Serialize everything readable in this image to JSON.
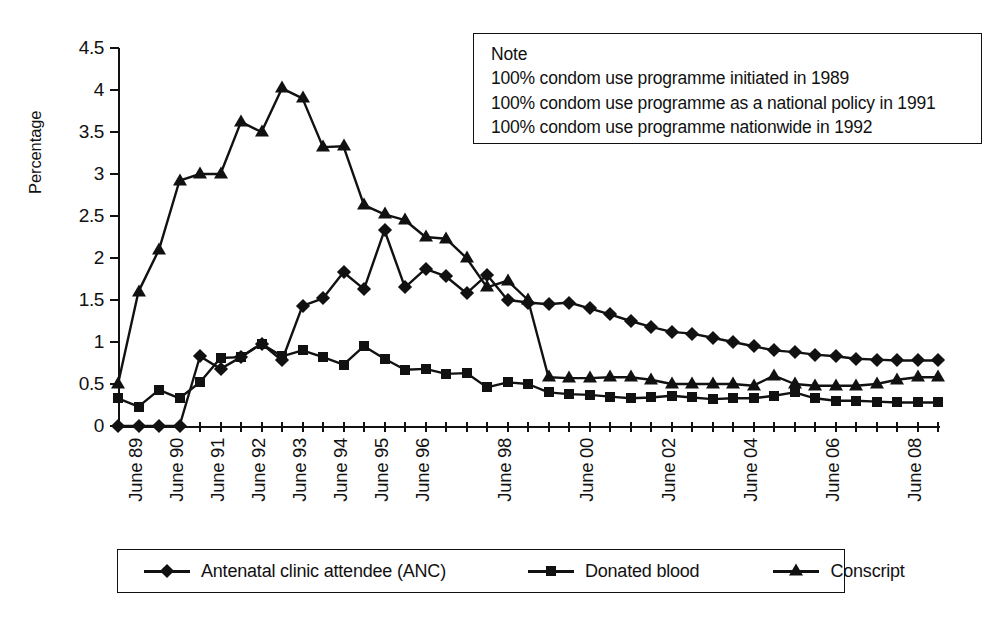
{
  "chart_data": {
    "type": "line",
    "title": "",
    "xlabel": "",
    "ylabel": "Percentage",
    "ylim": [
      0,
      4.5
    ],
    "yticks": [
      "0",
      "0.5",
      "1",
      "1.5",
      "2",
      "2.5",
      "3",
      "3.5",
      "4",
      "4.5"
    ],
    "grid": false,
    "legend_position": "bottom",
    "x": [
      "June 89",
      "Dec 89",
      "June 90",
      "Dec 90",
      "June 91",
      "Dec 91",
      "June 92",
      "Dec 92",
      "June 93",
      "Dec 93",
      "June 94",
      "Dec 94",
      "June 95",
      "Dec 95",
      "June 96",
      "Dec 96",
      "June 97",
      "Dec 97",
      "June 98",
      "Dec 98",
      "June 99",
      "Dec 99",
      "June 00",
      "Dec 00",
      "June 01",
      "Dec 01",
      "June 02",
      "Dec 02",
      "June 03",
      "Dec 03",
      "June 04",
      "Dec 04",
      "June 05",
      "Dec 05",
      "June 06",
      "Dec 06",
      "June 07",
      "Dec 07",
      "June 08",
      "Dec 08",
      "June 09"
    ],
    "xtick_labels": [
      {
        "index": 0,
        "label": "June 89"
      },
      {
        "index": 2,
        "label": "June 90"
      },
      {
        "index": 4,
        "label": "June 91"
      },
      {
        "index": 6,
        "label": "June 92"
      },
      {
        "index": 8,
        "label": "June 93"
      },
      {
        "index": 10,
        "label": "June 94"
      },
      {
        "index": 12,
        "label": "June 95"
      },
      {
        "index": 14,
        "label": "June 96"
      },
      {
        "index": 18,
        "label": "June 98"
      },
      {
        "index": 22,
        "label": "June 00"
      },
      {
        "index": 26,
        "label": "June 02"
      },
      {
        "index": 30,
        "label": "June 04"
      },
      {
        "index": 34,
        "label": "June 06"
      },
      {
        "index": 38,
        "label": "June 08"
      }
    ],
    "series": [
      {
        "name": "Antenatal clinic attendee (ANC)",
        "marker": "diamond",
        "values": [
          0.0,
          0.0,
          0.0,
          0.0,
          0.83,
          0.68,
          0.82,
          0.98,
          0.78,
          1.43,
          1.52,
          1.83,
          1.63,
          2.33,
          1.65,
          1.87,
          1.78,
          1.58,
          1.8,
          1.5,
          1.47,
          1.45,
          1.47,
          1.4,
          1.33,
          1.25,
          1.18,
          1.12,
          1.1,
          1.05,
          1.0,
          0.95,
          0.9,
          0.88,
          0.85,
          0.83,
          0.8,
          0.79,
          0.78,
          0.78,
          0.78
        ]
      },
      {
        "name": "Donated blood",
        "marker": "square",
        "values": [
          0.33,
          0.23,
          0.43,
          0.33,
          0.52,
          0.81,
          0.82,
          0.98,
          0.83,
          0.9,
          0.82,
          0.73,
          0.95,
          0.8,
          0.67,
          0.68,
          0.62,
          0.63,
          0.46,
          0.52,
          0.5,
          0.4,
          0.38,
          0.37,
          0.35,
          0.33,
          0.34,
          0.36,
          0.34,
          0.32,
          0.33,
          0.33,
          0.36,
          0.4,
          0.33,
          0.3,
          0.3,
          0.29,
          0.28,
          0.28,
          0.28
        ]
      },
      {
        "name": "Conscript",
        "marker": "triangle",
        "values": [
          0.5,
          1.6,
          2.1,
          2.92,
          3.0,
          3.0,
          3.62,
          3.5,
          4.02,
          3.9,
          3.32,
          3.33,
          2.63,
          2.52,
          2.45,
          2.25,
          2.23,
          2.0,
          1.65,
          1.73,
          1.5,
          0.58,
          0.57,
          0.57,
          0.58,
          0.58,
          0.55,
          0.5,
          0.5,
          0.5,
          0.5,
          0.48,
          0.6,
          0.5,
          0.48,
          0.48,
          0.48,
          0.5,
          0.55,
          0.58,
          0.58
        ]
      }
    ]
  },
  "note": {
    "heading": "Note",
    "lines": [
      "100% condom use programme initiated in 1989",
      "100% condom use programme as a national policy in 1991",
      "100% condom use programme nationwide in 1992"
    ]
  },
  "legend": {
    "items": [
      {
        "label": "Antenatal clinic attendee (ANC)",
        "marker": "diamond"
      },
      {
        "label": "Donated blood",
        "marker": "square"
      },
      {
        "label": "Conscript",
        "marker": "triangle"
      }
    ]
  },
  "colors": {
    "ink": "#111111",
    "background": "#ffffff"
  }
}
